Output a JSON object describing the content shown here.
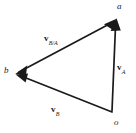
{
  "figure": {
    "kind": "relative-velocity-vector-triangle",
    "background_color": "#ffffff",
    "stroke_color": "#1a1a1a",
    "text_color": "#1a1a1a",
    "width": 136,
    "height": 133
  },
  "points": [
    {
      "id": "a",
      "label": "a",
      "x": 116,
      "y": 20
    },
    {
      "id": "b",
      "label": "b",
      "x": 16,
      "y": 73
    },
    {
      "id": "o",
      "label": "o",
      "x": 113,
      "y": 112
    }
  ],
  "vectors": [
    {
      "id": "v-b-over-a",
      "symbol": "v",
      "subscript": "B/A",
      "from": "a",
      "to": "b",
      "arrowhead_at": "both",
      "label_x": 44,
      "label_y": 34
    },
    {
      "id": "v-a",
      "symbol": "v",
      "subscript": "A",
      "from": "o",
      "to": "a",
      "arrowhead_at": "end",
      "label_x": 117,
      "label_y": 63
    },
    {
      "id": "v-b",
      "symbol": "v",
      "subscript": "B",
      "from": "o",
      "to": "b",
      "arrowhead_at": "end",
      "label_x": 51,
      "label_y": 105
    }
  ]
}
